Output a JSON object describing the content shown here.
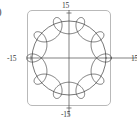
{
  "figure": {
    "edge_glyph": ")",
    "frame": {
      "style": "rounded-rect",
      "border_color": "#b9b9b9"
    },
    "axes": {
      "color": "#4a4a4a",
      "x_label": "",
      "y_label": "",
      "tick_top": "15",
      "tick_left": "-15",
      "tick_right": "15",
      "tick_bottom": "-15"
    }
  },
  "chart_data": {
    "type": "line",
    "title": "",
    "subtitle": "",
    "xlabel": "",
    "ylabel": "",
    "xlim": [
      -15,
      15
    ],
    "ylim": [
      -15,
      15
    ],
    "xticks": [
      -15,
      15
    ],
    "yticks": [
      -15,
      15
    ],
    "xticklabels": [
      "-15",
      "15"
    ],
    "yticklabels": [
      "-15",
      "15"
    ],
    "grid": false,
    "legend": null,
    "legend_position": "none",
    "axes_through_origin": true,
    "annotations": [],
    "series": [
      {
        "name": "outer-circle",
        "kind": "circle",
        "center": [
          0,
          0
        ],
        "radius": 13.0,
        "color": "#3c3c3c",
        "linewidth": 0.7
      },
      {
        "name": "hypotrochoid",
        "kind": "parametric-roulette",
        "description": "Roulette curve with nine inner loops inscribed in a circle of radius 13",
        "R": 13.0,
        "r": 1.44,
        "d": 3.2,
        "loops": 9,
        "t_range": [
          0,
          6.283185307179586
        ],
        "color": "#3c3c3c",
        "linewidth": 0.7
      }
    ]
  }
}
